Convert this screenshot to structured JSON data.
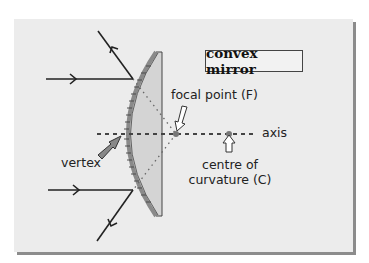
{
  "diagram": {
    "title": "convex mirror",
    "labels": {
      "focal_point": "focal point (F)",
      "axis": "axis",
      "vertex": "vertex",
      "centre_line1": "centre of",
      "centre_line2": "curvature (C)"
    },
    "colors": {
      "panel_bg": "#ececec",
      "panel_shadow": "#8c8c8c",
      "mirror_fill": "#d4d4d4",
      "mirror_surface": "#9a9a9a",
      "ray": "#222222",
      "point_marker": "#777777"
    },
    "elements": [
      "incident ray (top)",
      "reflected ray (top)",
      "incident ray (bottom)",
      "reflected ray (bottom)",
      "principal axis",
      "focal point F",
      "centre of curvature C",
      "vertex"
    ]
  }
}
